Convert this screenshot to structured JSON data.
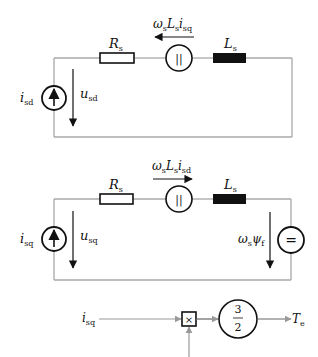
{
  "colors": {
    "wire": "#a8a8a8",
    "component": "#111111",
    "inductor_fill": "#111111",
    "background": "#ffffff"
  },
  "d_axis_circuit": {
    "resistor": {
      "symbol": "R",
      "sub": "s"
    },
    "inductor": {
      "symbol": "L",
      "sub": "s"
    },
    "coupling_source": {
      "label_omega": "ω",
      "label_omega_sub": "s",
      "label_L": "L",
      "label_L_sub": "s",
      "label_i": "i",
      "label_i_sub": "sq",
      "glyph": "||",
      "arrow_direction": "left"
    },
    "current_source": {
      "symbol": "i",
      "sub": "sd"
    },
    "voltage": {
      "symbol": "u",
      "sub": "sd"
    }
  },
  "q_axis_circuit": {
    "resistor": {
      "symbol": "R",
      "sub": "s"
    },
    "inductor": {
      "symbol": "L",
      "sub": "s"
    },
    "coupling_source": {
      "label_omega": "ω",
      "label_omega_sub": "s",
      "label_L": "L",
      "label_L_sub": "s",
      "label_i": "i",
      "label_i_sub": "sd",
      "glyph": "||",
      "arrow_direction": "right"
    },
    "current_source": {
      "symbol": "i",
      "sub": "sq"
    },
    "voltage": {
      "symbol": "u",
      "sub": "sq"
    },
    "back_emf": {
      "label_omega": "ω",
      "label_omega_sub": "s",
      "label_psi": "ψ",
      "label_psi_sub": "f",
      "glyph": "="
    }
  },
  "torque_block": {
    "input": {
      "symbol": "i",
      "sub": "sq"
    },
    "multiplier_glyph": "×",
    "gain_numerator": "3",
    "gain_denominator": "2",
    "output": {
      "symbol": "T",
      "sub": "e"
    }
  }
}
